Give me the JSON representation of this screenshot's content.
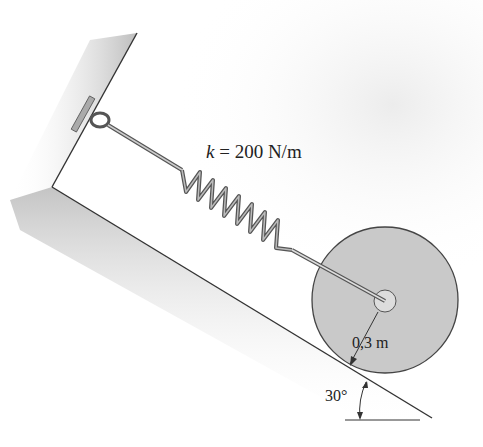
{
  "figure": {
    "type": "mechanics-diagram"
  },
  "labels": {
    "spring_symbol": "k",
    "spring_value": " = 200 N/m",
    "radius": "0,3 m",
    "angle": "30°"
  },
  "values": {
    "spring_constant": 200,
    "spring_units": "N/m",
    "disk_radius_m": 0.3,
    "incline_angle_deg": 30
  },
  "colors": {
    "shade": "#c8c8c8",
    "disk": "#c9c9c9",
    "line": "#333333"
  }
}
